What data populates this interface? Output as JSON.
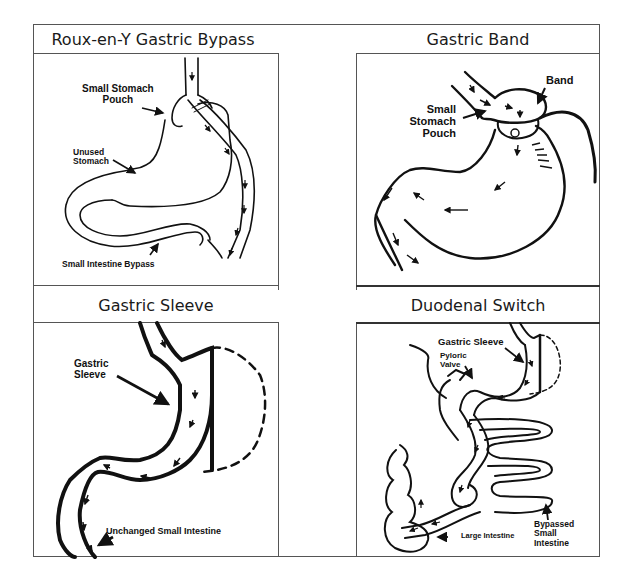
{
  "figure": {
    "panels": [
      {
        "id": "roux-en-y",
        "title": "Roux-en-Y Gastric Bypass",
        "labels": {
          "pouch_line1": "Small Stomach",
          "pouch_line2": "Pouch",
          "unused_line1": "Unused",
          "unused_line2": "Stomach",
          "bypass": "Small Intestine Bypass"
        }
      },
      {
        "id": "gastric-band",
        "title": "Gastric Band",
        "labels": {
          "band": "Band",
          "pouch_line1": "Small",
          "pouch_line2": "Stomach",
          "pouch_line3": "Pouch"
        }
      },
      {
        "id": "gastric-sleeve",
        "title": "Gastric Sleeve",
        "labels": {
          "sleeve_line1": "Gastric",
          "sleeve_line2": "Sleeve",
          "intestine": "Unchanged Small Intestine"
        }
      },
      {
        "id": "duodenal-switch",
        "title": "Duodenal Switch",
        "labels": {
          "sleeve": "Gastric Sleeve",
          "pyloric_line1": "Pyloric",
          "pyloric_line2": "Valve",
          "large_intestine": "Large Intestine",
          "bypassed_line1": "Bypassed",
          "bypassed_line2": "Small",
          "bypassed_line3": "Intestine"
        }
      }
    ]
  }
}
